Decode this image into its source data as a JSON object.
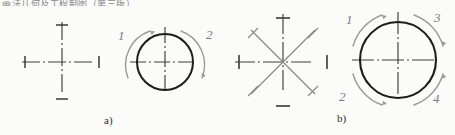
{
  "figure": {
    "title_fragment": "画法几何及工程制图（第三版）",
    "captions": {
      "a": "a)",
      "b": "b)"
    },
    "colors": {
      "outline": "#1d1d1d",
      "centerline": "#4a4a4a",
      "construction": "#8a8a8a",
      "arc_arrow": "#9a9a9a",
      "label": "#7a7a7a",
      "caption": "#2b2b2b",
      "background": "#fbfbfa"
    },
    "panels": [
      {
        "id": "a",
        "caption": "a)",
        "steps": [
          {
            "id": "a-step-1",
            "name": "center-lines-cross",
            "description": "Two perpendicular centre lines with end tick marks",
            "center": {
              "x": 62,
              "y": 62
            },
            "arm_length": 40,
            "tick_count": 4
          },
          {
            "id": "a-step-2",
            "name": "circle-two-arcs",
            "description": "Circle drawn in two arc strokes over the centre cross",
            "center": {
              "x": 165,
              "y": 62
            },
            "radius": 28,
            "arc_count": 2
          }
        ],
        "arc_labels": [
          {
            "text": "1",
            "position": "upper-left",
            "x": 118,
            "y": 32
          },
          {
            "text": "2",
            "position": "upper-right",
            "x": 205,
            "y": 31
          }
        ]
      },
      {
        "id": "b",
        "caption": "b)",
        "steps": [
          {
            "id": "b-step-1",
            "name": "eight-spoke-construction",
            "description": "Centre lines plus two 45-degree construction lines, eight ticks",
            "center": {
              "x": 283,
              "y": 62
            },
            "arm_length": 48,
            "spoke_count": 8
          },
          {
            "id": "b-step-2",
            "name": "circle-four-arcs",
            "description": "Large circle drawn in four quadrant arc strokes",
            "center": {
              "x": 398,
              "y": 60
            },
            "radius": 38,
            "arc_count": 4
          }
        ],
        "arc_labels": [
          {
            "text": "1",
            "position": "upper-left",
            "x": 350,
            "y": 16
          },
          {
            "text": "3",
            "position": "upper-right",
            "x": 432,
            "y": 14
          },
          {
            "text": "2",
            "position": "lower-left",
            "x": 342,
            "y": 92
          },
          {
            "text": "4",
            "position": "lower-right",
            "x": 431,
            "y": 93
          }
        ]
      }
    ]
  }
}
